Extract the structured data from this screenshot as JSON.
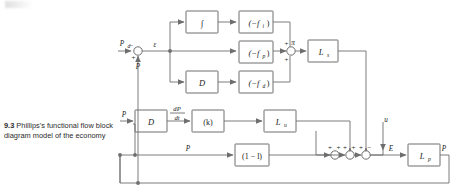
{
  "figure": {
    "number": "9.3",
    "caption": "Phillips's functional flow block diagram model of the economy",
    "type": "functional flow block diagram",
    "stroke_color": "#6e6e6e",
    "text_color": "#1a1a1a",
    "background": "#ffffff"
  },
  "blocks": {
    "integral": "∫",
    "derivative_top": "D",
    "gain_i": "(−f",
    "gain_i_sub": "i",
    "gain_p": "(−f",
    "gain_p_sub": "p",
    "gain_d": "(−f",
    "gain_d_sub": "d",
    "close_paren": ")",
    "lag_s": "L",
    "lag_s_sub": "s",
    "derivative_mid": "D",
    "accelerator": "(k)",
    "lag_u": "L",
    "lag_u_sub": "u",
    "propensity": "(1 − l)",
    "lag_p": "L",
    "lag_p_sub": "p"
  },
  "signals": {
    "demand": "P",
    "demand_sub": "d",
    "error": "ε",
    "feedback_p": "P",
    "sum_out": "π",
    "dpdt_num": "dP",
    "dpdt_den": "dt",
    "input_p_mid": "P",
    "input_p_low": "P",
    "exogenous": "u",
    "expenditure": "E",
    "output": "P"
  },
  "signs": {
    "input_demand": "−",
    "input_feedback": "+",
    "j2_top": "+",
    "j2_bottom": "+",
    "j3_left": "+",
    "j3_top": "+",
    "j4_left": "+",
    "j4_top": "+",
    "j5_left": "+",
    "j5_top": "−"
  }
}
